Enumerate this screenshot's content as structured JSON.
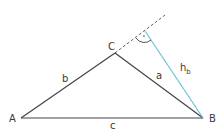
{
  "diagram": {
    "colors": {
      "sides": "#444444",
      "altitude": "#6fc3d8",
      "extension": "#666666",
      "background": "#ffffff"
    },
    "vertices": {
      "A": {
        "label": "A",
        "x": 21,
        "y": 118
      },
      "B": {
        "label": "B",
        "x": 203,
        "y": 118
      },
      "C": {
        "label": "C",
        "x": 115,
        "y": 53
      }
    },
    "sides": {
      "a": {
        "label": "a",
        "from": "B",
        "to": "C"
      },
      "b": {
        "label": "b",
        "from": "A",
        "to": "C"
      },
      "c": {
        "label": "c",
        "from": "A",
        "to": "B"
      }
    },
    "altitude": {
      "label": "h",
      "subscript": "b",
      "from": "B",
      "foot": {
        "x": 145,
        "y": 31
      }
    },
    "extension": {
      "from": "C",
      "to": {
        "x": 165,
        "y": 15
      },
      "style": "dashed"
    },
    "right_angle_marker": {
      "at": "foot",
      "dot": true
    }
  }
}
